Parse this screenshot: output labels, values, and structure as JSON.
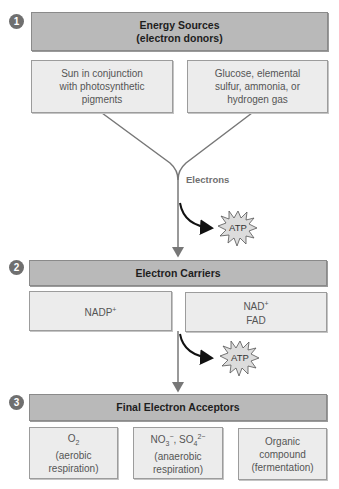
{
  "sections": [
    {
      "number": "1",
      "title_line1": "Energy Sources",
      "title_line2": "(electron donors)",
      "boxes": [
        {
          "lines": [
            "Sun in conjunction",
            "with photosynthetic",
            "pigments"
          ]
        },
        {
          "lines": [
            "Glucose, elemental",
            "sulfur, ammonia, or",
            "hydrogen gas"
          ]
        }
      ]
    },
    {
      "number": "2",
      "title_line1": "Electron Carriers",
      "boxes": [
        {
          "base": "NADP",
          "sup": "+"
        },
        {
          "line1_base": "NAD",
          "line1_sup": "+",
          "line2": "FAD"
        }
      ]
    },
    {
      "number": "3",
      "title_line1": "Final Electron Acceptors",
      "boxes": [
        {
          "formula_base": "O",
          "formula_sub": "2",
          "lines": [
            "(aerobic",
            "respiration)"
          ]
        },
        {
          "f1_base": "NO",
          "f1_sub": "3",
          "f1_sup": "−",
          "sep": ", ",
          "f2_base": "SO",
          "f2_sub": "4",
          "f2_sup": "2−",
          "lines": [
            "(anaerobic",
            "respiration)"
          ]
        },
        {
          "lines": [
            "Organic",
            "compound",
            "(fermentation)"
          ]
        }
      ]
    }
  ],
  "flow": {
    "electrons_label": "Electrons",
    "atp_label_1": "ATP",
    "atp_label_2": "ATP"
  },
  "colors": {
    "header_fill": "#b9b9b9",
    "sub_fill": "#ececec",
    "line": "#777777",
    "circle": "#6f6f6f"
  }
}
